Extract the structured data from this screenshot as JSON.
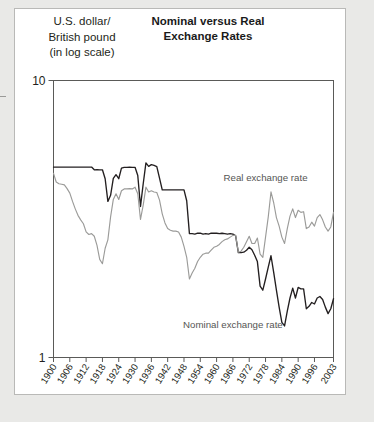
{
  "figure": {
    "title_line1": "Nominal versus Real",
    "title_line2": "Exchange Rates",
    "axis_caption_line1": "U.S. dollar/",
    "axis_caption_line2": "British pound",
    "axis_caption_line3": "(in log scale)"
  },
  "chart_data": {
    "type": "line",
    "title": "Nominal versus Real Exchange Rates",
    "subtitle": "",
    "xlabel": "",
    "ylabel": "U.S. dollar/British pound (in log scale)",
    "yscale": "log",
    "ylim": [
      1,
      10
    ],
    "ytick_labels": [
      "10",
      "1"
    ],
    "ytick_values": [
      10,
      1
    ],
    "xlim": [
      1900,
      2003
    ],
    "grid": false,
    "legend": "inline-annotations",
    "annotations": [
      {
        "text": "Real exchange rate",
        "x": 1978,
        "y": 4.35
      },
      {
        "text": "Nominal exchange rate",
        "x": 1966,
        "y": 1.28
      }
    ],
    "series": [
      {
        "name": "Nominal exchange rate",
        "color": "#231f20",
        "x": [
          1900,
          1901,
          1902,
          1903,
          1904,
          1905,
          1906,
          1907,
          1908,
          1909,
          1910,
          1911,
          1912,
          1913,
          1914,
          1915,
          1916,
          1917,
          1918,
          1919,
          1920,
          1921,
          1922,
          1923,
          1924,
          1925,
          1926,
          1927,
          1928,
          1929,
          1930,
          1931,
          1932,
          1933,
          1934,
          1935,
          1936,
          1937,
          1938,
          1939,
          1940,
          1941,
          1942,
          1943,
          1944,
          1945,
          1946,
          1947,
          1948,
          1949,
          1950,
          1951,
          1952,
          1953,
          1954,
          1955,
          1956,
          1957,
          1958,
          1959,
          1960,
          1961,
          1962,
          1963,
          1964,
          1965,
          1966,
          1967,
          1968,
          1969,
          1970,
          1971,
          1972,
          1973,
          1974,
          1975,
          1976,
          1977,
          1978,
          1979,
          1980,
          1981,
          1982,
          1983,
          1984,
          1985,
          1986,
          1987,
          1988,
          1989,
          1990,
          1991,
          1992,
          1993,
          1994,
          1995,
          1996,
          1997,
          1998,
          1999,
          2000,
          2001,
          2002,
          2003
        ],
        "values": [
          4.87,
          4.87,
          4.87,
          4.87,
          4.87,
          4.87,
          4.87,
          4.87,
          4.87,
          4.87,
          4.87,
          4.87,
          4.87,
          4.87,
          4.87,
          4.76,
          4.77,
          4.76,
          4.76,
          4.42,
          3.66,
          3.85,
          4.43,
          4.57,
          4.42,
          4.83,
          4.86,
          4.86,
          4.87,
          4.86,
          4.86,
          4.54,
          3.51,
          4.24,
          5.04,
          4.9,
          4.97,
          4.94,
          4.89,
          4.44,
          4.03,
          4.03,
          4.03,
          4.03,
          4.03,
          4.03,
          4.03,
          4.03,
          4.03,
          3.68,
          2.8,
          2.8,
          2.79,
          2.81,
          2.81,
          2.79,
          2.8,
          2.79,
          2.81,
          2.81,
          2.81,
          2.8,
          2.81,
          2.8,
          2.79,
          2.8,
          2.79,
          2.75,
          2.39,
          2.39,
          2.4,
          2.44,
          2.5,
          2.45,
          2.34,
          2.22,
          1.81,
          1.75,
          1.92,
          2.12,
          2.33,
          2.03,
          1.75,
          1.52,
          1.34,
          1.3,
          1.47,
          1.64,
          1.78,
          1.64,
          1.79,
          1.77,
          1.77,
          1.5,
          1.53,
          1.58,
          1.56,
          1.64,
          1.66,
          1.62,
          1.52,
          1.44,
          1.5,
          1.63
        ]
      },
      {
        "name": "Real exchange rate",
        "color": "#9b9b99",
        "x": [
          1900,
          1901,
          1902,
          1903,
          1904,
          1905,
          1906,
          1907,
          1908,
          1909,
          1910,
          1911,
          1912,
          1913,
          1914,
          1915,
          1916,
          1917,
          1918,
          1919,
          1920,
          1921,
          1922,
          1923,
          1924,
          1925,
          1926,
          1927,
          1928,
          1929,
          1930,
          1931,
          1932,
          1933,
          1934,
          1935,
          1936,
          1937,
          1938,
          1939,
          1940,
          1941,
          1942,
          1943,
          1944,
          1945,
          1946,
          1947,
          1948,
          1949,
          1950,
          1951,
          1952,
          1953,
          1954,
          1955,
          1956,
          1957,
          1958,
          1959,
          1960,
          1961,
          1962,
          1963,
          1964,
          1965,
          1966,
          1967,
          1968,
          1969,
          1970,
          1971,
          1972,
          1973,
          1974,
          1975,
          1976,
          1977,
          1978,
          1979,
          1980,
          1981,
          1982,
          1983,
          1984,
          1985,
          1986,
          1987,
          1988,
          1989,
          1990,
          1991,
          1992,
          1993,
          1994,
          1995,
          1996,
          1997,
          1998,
          1999,
          2000,
          2001,
          2002,
          2003
        ],
        "values": [
          4.62,
          4.3,
          4.24,
          4.22,
          4.2,
          4.07,
          3.92,
          3.66,
          3.44,
          3.26,
          3.14,
          3.04,
          2.84,
          2.78,
          2.8,
          2.74,
          2.54,
          2.26,
          2.18,
          2.48,
          2.66,
          3.22,
          3.72,
          3.9,
          3.72,
          4.0,
          4.06,
          4.06,
          4.07,
          4.06,
          4.12,
          3.9,
          3.15,
          3.55,
          4.12,
          3.96,
          4.0,
          3.96,
          3.94,
          3.7,
          3.3,
          3.06,
          2.92,
          2.88,
          2.86,
          2.86,
          2.84,
          2.72,
          2.52,
          2.3,
          1.92,
          2.02,
          2.1,
          2.22,
          2.3,
          2.36,
          2.38,
          2.38,
          2.44,
          2.5,
          2.52,
          2.56,
          2.62,
          2.66,
          2.68,
          2.72,
          2.76,
          2.76,
          2.4,
          2.42,
          2.5,
          2.62,
          2.74,
          2.58,
          2.58,
          2.7,
          2.36,
          2.3,
          2.72,
          3.22,
          3.96,
          3.62,
          3.2,
          2.98,
          2.72,
          2.58,
          2.92,
          3.24,
          3.44,
          3.2,
          3.4,
          3.34,
          3.36,
          2.92,
          2.96,
          3.08,
          2.98,
          3.2,
          3.28,
          3.14,
          2.96,
          2.86,
          2.96,
          3.34
        ]
      }
    ],
    "xtick_labels": [
      "1900",
      "1906",
      "1912",
      "1918",
      "1924",
      "1930",
      "1936",
      "1942",
      "1948",
      "1954",
      "1960",
      "1966",
      "1972",
      "1978",
      "1984",
      "1990",
      "1996",
      "2003"
    ],
    "xtick_values": [
      1900,
      1906,
      1912,
      1918,
      1924,
      1930,
      1936,
      1942,
      1948,
      1954,
      1960,
      1966,
      1972,
      1978,
      1984,
      1990,
      1996,
      2003
    ]
  }
}
